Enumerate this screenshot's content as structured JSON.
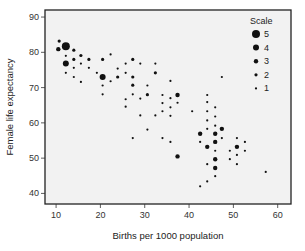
{
  "chart_data": {
    "type": "scatter",
    "title": "",
    "xlabel": "Births per 1000 population",
    "ylabel": "Female life expectancy",
    "xlim": [
      7.5,
      63
    ],
    "ylim": [
      37,
      92
    ],
    "xticks": [
      10,
      20,
      30,
      40,
      50,
      60
    ],
    "yticks": [
      40,
      50,
      60,
      70,
      80,
      90
    ],
    "grid": false,
    "legend": {
      "title": "Scale",
      "placement": "top-right",
      "entries": [
        {
          "label": "5",
          "size": 5
        },
        {
          "label": "4",
          "size": 4
        },
        {
          "label": "3",
          "size": 3
        },
        {
          "label": "2",
          "size": 2
        },
        {
          "label": "1",
          "size": 1
        }
      ]
    },
    "colors": {
      "point": "#111111",
      "background": "#f2f2f2",
      "frame": "#222222"
    },
    "points": [
      {
        "x": 10.7,
        "y": 83.2,
        "size": 2
      },
      {
        "x": 12.2,
        "y": 81.7,
        "size": 5
      },
      {
        "x": 10.5,
        "y": 80.9,
        "size": 3
      },
      {
        "x": 14.0,
        "y": 80.6,
        "size": 2
      },
      {
        "x": 12.2,
        "y": 79.0,
        "size": 1
      },
      {
        "x": 15.6,
        "y": 79.1,
        "size": 2
      },
      {
        "x": 14.0,
        "y": 78.0,
        "size": 2
      },
      {
        "x": 17.4,
        "y": 78.0,
        "size": 2
      },
      {
        "x": 20.5,
        "y": 78.0,
        "size": 2
      },
      {
        "x": 12.2,
        "y": 76.8,
        "size": 4
      },
      {
        "x": 15.6,
        "y": 76.8,
        "size": 1
      },
      {
        "x": 14.0,
        "y": 75.6,
        "size": 1
      },
      {
        "x": 17.4,
        "y": 75.6,
        "size": 1
      },
      {
        "x": 12.2,
        "y": 74.2,
        "size": 1
      },
      {
        "x": 19.2,
        "y": 74.2,
        "size": 1
      },
      {
        "x": 14.0,
        "y": 73.0,
        "size": 1
      },
      {
        "x": 20.5,
        "y": 73.0,
        "size": 4
      },
      {
        "x": 15.6,
        "y": 71.6,
        "size": 1
      },
      {
        "x": 20.5,
        "y": 70.6,
        "size": 1
      },
      {
        "x": 22.3,
        "y": 79.4,
        "size": 1
      },
      {
        "x": 27.3,
        "y": 78.0,
        "size": 2
      },
      {
        "x": 25.7,
        "y": 76.8,
        "size": 1
      },
      {
        "x": 29.0,
        "y": 76.8,
        "size": 1
      },
      {
        "x": 32.4,
        "y": 76.8,
        "size": 1
      },
      {
        "x": 23.9,
        "y": 75.4,
        "size": 1
      },
      {
        "x": 25.7,
        "y": 74.2,
        "size": 1
      },
      {
        "x": 32.4,
        "y": 74.2,
        "size": 2
      },
      {
        "x": 23.9,
        "y": 73.0,
        "size": 2
      },
      {
        "x": 27.3,
        "y": 73.0,
        "size": 2
      },
      {
        "x": 22.3,
        "y": 71.8,
        "size": 1
      },
      {
        "x": 27.3,
        "y": 70.7,
        "size": 2
      },
      {
        "x": 30.6,
        "y": 70.6,
        "size": 1
      },
      {
        "x": 20.5,
        "y": 68.1,
        "size": 1
      },
      {
        "x": 27.3,
        "y": 68.1,
        "size": 1
      },
      {
        "x": 30.6,
        "y": 68.0,
        "size": 2
      },
      {
        "x": 25.7,
        "y": 66.7,
        "size": 1
      },
      {
        "x": 29.0,
        "y": 66.9,
        "size": 1
      },
      {
        "x": 25.7,
        "y": 64.6,
        "size": 1
      },
      {
        "x": 35.8,
        "y": 71.9,
        "size": 1
      },
      {
        "x": 34.0,
        "y": 67.9,
        "size": 1
      },
      {
        "x": 35.8,
        "y": 67.0,
        "size": 1
      },
      {
        "x": 37.4,
        "y": 67.9,
        "size": 3
      },
      {
        "x": 34.0,
        "y": 65.6,
        "size": 1
      },
      {
        "x": 37.4,
        "y": 65.7,
        "size": 1
      },
      {
        "x": 35.8,
        "y": 64.4,
        "size": 1
      },
      {
        "x": 34.0,
        "y": 63.3,
        "size": 1
      },
      {
        "x": 40.7,
        "y": 63.3,
        "size": 1
      },
      {
        "x": 29.0,
        "y": 62.1,
        "size": 1
      },
      {
        "x": 32.4,
        "y": 62.1,
        "size": 1
      },
      {
        "x": 35.8,
        "y": 62.0,
        "size": 1
      },
      {
        "x": 47.4,
        "y": 73.0,
        "size": 1
      },
      {
        "x": 44.1,
        "y": 67.9,
        "size": 1
      },
      {
        "x": 44.1,
        "y": 65.9,
        "size": 1
      },
      {
        "x": 45.9,
        "y": 64.4,
        "size": 1
      },
      {
        "x": 44.1,
        "y": 63.3,
        "size": 1
      },
      {
        "x": 44.1,
        "y": 60.7,
        "size": 1
      },
      {
        "x": 45.9,
        "y": 61.8,
        "size": 1
      },
      {
        "x": 45.9,
        "y": 59.2,
        "size": 1
      },
      {
        "x": 44.1,
        "y": 58.3,
        "size": 1
      },
      {
        "x": 47.4,
        "y": 58.3,
        "size": 3
      },
      {
        "x": 42.5,
        "y": 56.9,
        "size": 3
      },
      {
        "x": 45.9,
        "y": 56.9,
        "size": 3
      },
      {
        "x": 47.4,
        "y": 55.7,
        "size": 1
      },
      {
        "x": 50.8,
        "y": 55.7,
        "size": 1
      },
      {
        "x": 35.8,
        "y": 54.6,
        "size": 1
      },
      {
        "x": 42.5,
        "y": 54.6,
        "size": 1
      },
      {
        "x": 45.9,
        "y": 54.6,
        "size": 3
      },
      {
        "x": 52.6,
        "y": 54.6,
        "size": 1
      },
      {
        "x": 44.1,
        "y": 53.2,
        "size": 3
      },
      {
        "x": 50.8,
        "y": 53.2,
        "size": 3
      },
      {
        "x": 45.9,
        "y": 52.1,
        "size": 1
      },
      {
        "x": 49.2,
        "y": 52.1,
        "size": 1
      },
      {
        "x": 52.6,
        "y": 52.1,
        "size": 1
      },
      {
        "x": 50.8,
        "y": 50.9,
        "size": 1
      },
      {
        "x": 45.9,
        "y": 49.7,
        "size": 3
      },
      {
        "x": 49.2,
        "y": 49.7,
        "size": 1
      },
      {
        "x": 44.1,
        "y": 48.3,
        "size": 1
      },
      {
        "x": 50.8,
        "y": 48.3,
        "size": 1
      },
      {
        "x": 45.9,
        "y": 47.2,
        "size": 3
      },
      {
        "x": 57.3,
        "y": 46.1,
        "size": 1
      },
      {
        "x": 45.9,
        "y": 44.9,
        "size": 1
      },
      {
        "x": 44.1,
        "y": 43.4,
        "size": 1
      },
      {
        "x": 42.5,
        "y": 42.0,
        "size": 1
      },
      {
        "x": 30.6,
        "y": 58.1,
        "size": 1
      },
      {
        "x": 27.3,
        "y": 55.7,
        "size": 1
      },
      {
        "x": 34.0,
        "y": 55.7,
        "size": 1
      },
      {
        "x": 37.4,
        "y": 50.5,
        "size": 3
      }
    ]
  }
}
